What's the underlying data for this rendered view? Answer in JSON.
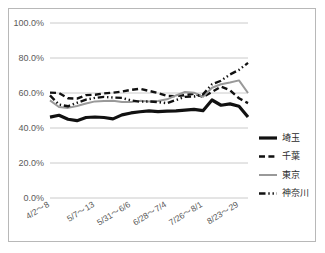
{
  "chart_data": {
    "type": "line",
    "title": "",
    "subtitle": "",
    "xlabel": "",
    "ylabel": "",
    "ylim": [
      0,
      100
    ],
    "ytick_labels": [
      "100.0%",
      "80.0%",
      "60.0%",
      "40.0%",
      "20.0%",
      "0.0%"
    ],
    "ytick_values": [
      100,
      80,
      60,
      40,
      20,
      0
    ],
    "grid": true,
    "legend_position": "right",
    "x_tick_labels": [
      "4/2～8",
      "5/7～13",
      "5/31～6/6",
      "6/28～7/4",
      "7/26～8/1",
      "8/23～29"
    ],
    "x_tick_indices": [
      0,
      5,
      9,
      13,
      17,
      21
    ],
    "x": [
      "4/2～8",
      "4/9～15",
      "4/16～22",
      "4/23～29",
      "4/30～5/6",
      "5/7～13",
      "5/14～20",
      "5/21～27",
      "5/24～30",
      "5/31～6/6",
      "6/7～13",
      "6/14～20",
      "6/21～27",
      "6/28～7/4",
      "7/5～11",
      "7/12～18",
      "7/19～25",
      "7/26～8/1",
      "8/2～8",
      "8/9～15",
      "8/16～22",
      "8/23～29",
      "8/30～9/5"
    ],
    "series": [
      {
        "name": "埼玉",
        "color": "#111111",
        "style": "solid",
        "width": 3.2,
        "values": [
          46.2,
          47.3,
          45.0,
          44.2,
          46.0,
          46.3,
          46.0,
          45.2,
          47.5,
          48.6,
          49.3,
          49.8,
          49.4,
          49.6,
          49.8,
          50.2,
          50.6,
          49.9,
          56.0,
          53.0,
          53.8,
          52.4,
          46.3
        ]
      },
      {
        "name": "千葉",
        "color": "#111111",
        "style": "dashed",
        "width": 2.4,
        "values": [
          60.2,
          60.0,
          57.0,
          56.8,
          58.8,
          59.0,
          59.8,
          60.2,
          60.8,
          61.8,
          62.4,
          61.2,
          60.0,
          58.4,
          58.2,
          58.8,
          59.6,
          57.8,
          60.6,
          63.6,
          61.6,
          57.0,
          54.2
        ]
      },
      {
        "name": "東京",
        "color": "#999999",
        "style": "solid",
        "width": 2.0,
        "values": [
          55.8,
          52.0,
          51.5,
          52.6,
          54.0,
          55.2,
          55.4,
          55.6,
          54.8,
          54.8,
          55.5,
          55.2,
          55.4,
          56.4,
          58.6,
          60.6,
          60.2,
          57.8,
          63.0,
          65.0,
          66.0,
          67.2,
          60.0
        ]
      },
      {
        "name": "神奈川",
        "color": "#111111",
        "style": "dashdotdot",
        "width": 2.4,
        "values": [
          58.6,
          53.4,
          52.4,
          54.4,
          56.2,
          57.2,
          57.8,
          57.4,
          57.2,
          55.8,
          55.0,
          55.2,
          54.8,
          54.2,
          56.0,
          57.8,
          58.0,
          59.2,
          65.0,
          67.0,
          70.6,
          73.2,
          77.2
        ]
      }
    ]
  },
  "legend": {
    "items": [
      {
        "label": "埼玉",
        "style": "solid",
        "color": "#111111"
      },
      {
        "label": "千葉",
        "style": "dashed",
        "color": "#111111"
      },
      {
        "label": "東京",
        "style": "solid",
        "color": "#999999"
      },
      {
        "label": "神奈川",
        "style": "dashdotdot",
        "color": "#111111"
      }
    ]
  },
  "frame": {
    "border_color": "#b8b8b8",
    "background": "#ffffff"
  }
}
